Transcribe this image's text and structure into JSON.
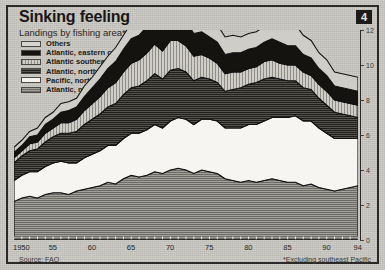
{
  "chart_data": {
    "type": "area",
    "stacked": true,
    "title": "Sinking feeling",
    "subtitle": "Landings by fishing area*, m tonnes",
    "badge": "4",
    "xlabel": "",
    "ylabel": "m tonnes",
    "ylim": [
      0,
      12
    ],
    "yticks": [
      0,
      2,
      4,
      6,
      8,
      10,
      12
    ],
    "ytick_labels": [
      "0",
      "2",
      "4",
      "6",
      "8",
      "10",
      "12"
    ],
    "xlim": [
      1950,
      1994
    ],
    "xticks": [
      1950,
      1955,
      1960,
      1965,
      1970,
      1975,
      1980,
      1985,
      1990,
      1994
    ],
    "xtick_labels": [
      "1950",
      "55",
      "60",
      "65",
      "70",
      "75",
      "80",
      "85",
      "90",
      "94"
    ],
    "grid": false,
    "legend_position": "top-left",
    "source": "Source: FAO",
    "footnote": "*Excluding southeast Pacific",
    "x": [
      1950,
      1951,
      1952,
      1953,
      1954,
      1955,
      1956,
      1957,
      1958,
      1959,
      1960,
      1961,
      1962,
      1963,
      1964,
      1965,
      1966,
      1967,
      1968,
      1969,
      1970,
      1971,
      1972,
      1973,
      1974,
      1975,
      1976,
      1977,
      1978,
      1979,
      1980,
      1981,
      1982,
      1983,
      1984,
      1985,
      1986,
      1987,
      1988,
      1989,
      1990,
      1991,
      1992,
      1993,
      1994
    ],
    "series": [
      {
        "name": "Atlantic, northeast",
        "key": "atlantic_northeast",
        "pattern": "dark-grey-hatch",
        "color": "#8e8c86",
        "values": [
          2.2,
          2.4,
          2.5,
          2.4,
          2.6,
          2.7,
          2.7,
          2.6,
          2.8,
          2.9,
          3.0,
          3.1,
          3.3,
          3.2,
          3.5,
          3.7,
          3.6,
          3.7,
          3.9,
          3.8,
          4.0,
          4.1,
          4.0,
          3.8,
          4.0,
          3.9,
          3.8,
          3.5,
          3.4,
          3.3,
          3.4,
          3.3,
          3.4,
          3.5,
          3.4,
          3.3,
          3.3,
          3.1,
          3.2,
          3.0,
          2.9,
          2.8,
          2.9,
          3.0,
          3.1
        ]
      },
      {
        "name": "Pacific, northwest",
        "key": "pacific_northwest",
        "pattern": "white",
        "color": "#f4f3ef",
        "values": [
          1.2,
          1.3,
          1.4,
          1.5,
          1.6,
          1.7,
          1.8,
          1.8,
          1.6,
          1.8,
          1.9,
          2.0,
          2.1,
          2.2,
          2.3,
          2.4,
          2.5,
          2.6,
          2.7,
          2.6,
          2.8,
          2.9,
          2.9,
          2.8,
          2.9,
          3.0,
          3.0,
          2.9,
          3.0,
          3.1,
          3.2,
          3.3,
          3.4,
          3.5,
          3.6,
          3.7,
          3.8,
          3.7,
          3.6,
          3.4,
          3.2,
          3.0,
          2.9,
          2.8,
          2.7
        ]
      },
      {
        "name": "Atlantic, northwest",
        "key": "atlantic_northwest",
        "pattern": "dark-hatch",
        "color": "#3d3b37",
        "values": [
          1.0,
          1.1,
          1.2,
          1.3,
          1.4,
          1.5,
          1.6,
          1.7,
          1.8,
          1.9,
          2.0,
          2.1,
          2.2,
          2.4,
          2.5,
          2.6,
          2.7,
          2.8,
          2.9,
          2.8,
          2.9,
          2.8,
          2.7,
          2.5,
          2.4,
          2.3,
          2.2,
          2.1,
          2.2,
          2.3,
          2.3,
          2.4,
          2.4,
          2.3,
          2.2,
          2.1,
          2.0,
          1.9,
          1.8,
          1.7,
          1.6,
          1.5,
          1.4,
          1.3,
          1.2
        ]
      },
      {
        "name": "Atlantic southeast",
        "key": "atlantic_southeast",
        "pattern": "light-hatch",
        "color": "#c6c4bd",
        "values": [
          0.3,
          0.3,
          0.4,
          0.4,
          0.5,
          0.5,
          0.6,
          0.6,
          0.7,
          0.8,
          0.9,
          1.0,
          1.1,
          1.2,
          1.3,
          1.4,
          1.5,
          1.6,
          1.7,
          1.6,
          1.7,
          1.6,
          1.5,
          1.4,
          1.3,
          1.2,
          1.1,
          1.0,
          1.0,
          0.9,
          0.9,
          0.9,
          1.0,
          1.0,
          0.9,
          0.9,
          0.9,
          0.9,
          0.8,
          0.8,
          0.8,
          0.7,
          0.7,
          0.7,
          0.7
        ]
      },
      {
        "name": "Atlantic, eastern central",
        "key": "atlantic_eastern_central",
        "pattern": "solid-black",
        "color": "#14130f",
        "values": [
          0.3,
          0.3,
          0.4,
          0.4,
          0.5,
          0.5,
          0.6,
          0.7,
          0.7,
          0.8,
          0.9,
          1.0,
          1.1,
          1.2,
          1.3,
          1.4,
          1.4,
          1.5,
          1.5,
          1.4,
          1.5,
          1.4,
          1.4,
          1.3,
          1.3,
          1.2,
          1.2,
          1.1,
          1.1,
          1.1,
          1.1,
          1.1,
          1.1,
          1.2,
          1.2,
          1.1,
          1.1,
          1.0,
          1.0,
          0.9,
          0.9,
          0.8,
          0.8,
          0.8,
          0.8
        ]
      },
      {
        "name": "Others",
        "key": "others",
        "pattern": "outline",
        "color": "#d6d4cf",
        "values": [
          0.3,
          0.3,
          0.3,
          0.4,
          0.4,
          0.4,
          0.5,
          0.5,
          0.5,
          0.6,
          0.6,
          0.7,
          0.7,
          0.8,
          0.8,
          0.9,
          0.9,
          1.0,
          1.0,
          1.0,
          1.1,
          1.2,
          1.1,
          1.1,
          1.0,
          1.0,
          1.0,
          1.0,
          1.0,
          0.9,
          0.9,
          0.9,
          0.9,
          0.9,
          1.0,
          1.1,
          1.2,
          1.1,
          1.0,
          0.9,
          0.9,
          0.8,
          0.8,
          0.8,
          0.8
        ]
      }
    ],
    "totals": [
      5.3,
      5.7,
      6.2,
      6.4,
      7.0,
      7.3,
      7.8,
      7.9,
      8.1,
      8.8,
      9.3,
      9.9,
      10.5,
      11.0,
      11.7,
      12.4,
      12.6,
      13.2,
      13.7,
      13.2,
      14.0,
      14.0,
      13.6,
      12.9,
      12.9,
      12.6,
      12.3,
      11.6,
      11.7,
      11.6,
      11.8,
      11.9,
      12.2,
      12.4,
      12.3,
      12.2,
      12.3,
      11.7,
      11.4,
      10.7,
      10.3,
      9.6,
      9.5,
      9.4,
      9.3
    ]
  },
  "legend": {
    "items": [
      {
        "label": "Others",
        "swatch": "p-others"
      },
      {
        "label": "Atlantic, eastern central",
        "swatch": "p-atl-ec"
      },
      {
        "label": "Atlantic southeast",
        "swatch": "p-atl-se"
      },
      {
        "label": "Atlantic, northwest",
        "swatch": "p-atl-nw"
      },
      {
        "label": "Pacific, northwest",
        "swatch": "p-pac-nw"
      },
      {
        "label": "Atlantic, northeast",
        "swatch": "p-atl-ne"
      }
    ]
  }
}
